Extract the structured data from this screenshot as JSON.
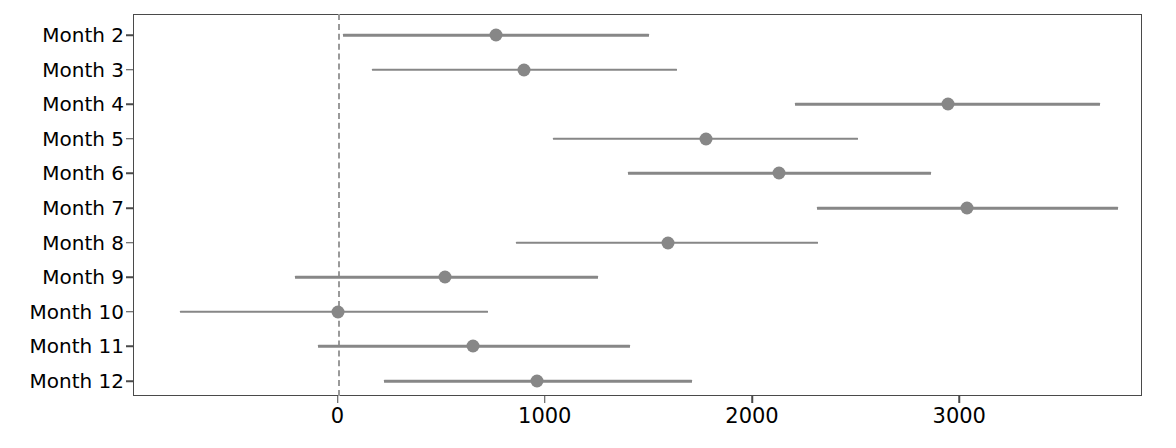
{
  "chart_data": {
    "type": "scatter",
    "subtype": "forest-plot",
    "title": "",
    "xlabel": "",
    "ylabel": "",
    "categories": [
      "Month  2",
      "Month  3",
      "Month  4",
      "Month  5",
      "Month  6",
      "Month  7",
      "Month  8",
      "Month  9",
      "Month  10",
      "Month  11",
      "Month  12"
    ],
    "series": [
      {
        "name": "Estimate",
        "values": [
          765,
          900,
          2944,
          1778,
          2130,
          3035,
          1594,
          520,
          0,
          655,
          963
        ]
      },
      {
        "name": "Lower CI",
        "values": [
          25,
          165,
          2206,
          1040,
          1400,
          2313,
          860,
          -203,
          -760,
          -92,
          222
        ]
      },
      {
        "name": "Upper CI",
        "values": [
          1505,
          1640,
          3677,
          2510,
          2866,
          3764,
          2318,
          1257,
          725,
          1412,
          1710
        ]
      }
    ],
    "points": [
      {
        "category": "Month  2",
        "estimate": 765,
        "lower": 25,
        "upper": 1505
      },
      {
        "category": "Month  3",
        "estimate": 900,
        "lower": 165,
        "upper": 1640
      },
      {
        "category": "Month  4",
        "estimate": 2944,
        "lower": 2206,
        "upper": 3677
      },
      {
        "category": "Month  5",
        "estimate": 1778,
        "lower": 1040,
        "upper": 2510
      },
      {
        "category": "Month  6",
        "estimate": 2130,
        "lower": 1400,
        "upper": 2866
      },
      {
        "category": "Month  7",
        "estimate": 3035,
        "lower": 2313,
        "upper": 3764
      },
      {
        "category": "Month  8",
        "estimate": 1594,
        "lower": 860,
        "upper": 2318
      },
      {
        "category": "Month  9",
        "estimate": 520,
        "lower": -203,
        "upper": 1257
      },
      {
        "category": "Month  10",
        "estimate": 0,
        "lower": -760,
        "upper": 725
      },
      {
        "category": "Month  11",
        "estimate": 655,
        "lower": -92,
        "upper": 1412
      },
      {
        "category": "Month  12",
        "estimate": 963,
        "lower": 222,
        "upper": 1710
      }
    ],
    "xticks": [
      0,
      1000,
      2000,
      3000
    ],
    "xtick_labels": [
      "0",
      "1000",
      "2000",
      "3000"
    ],
    "xlim": [
      -985,
      3875
    ],
    "grid": false,
    "legend": null,
    "reference_line": {
      "value": 0,
      "style": "dashed",
      "color": "#9a9a9a"
    },
    "colors": {
      "marker": "#878787",
      "whisker": "#878787",
      "frame": "#4a4a4a",
      "text": "#000000",
      "background": "#ffffff"
    }
  }
}
